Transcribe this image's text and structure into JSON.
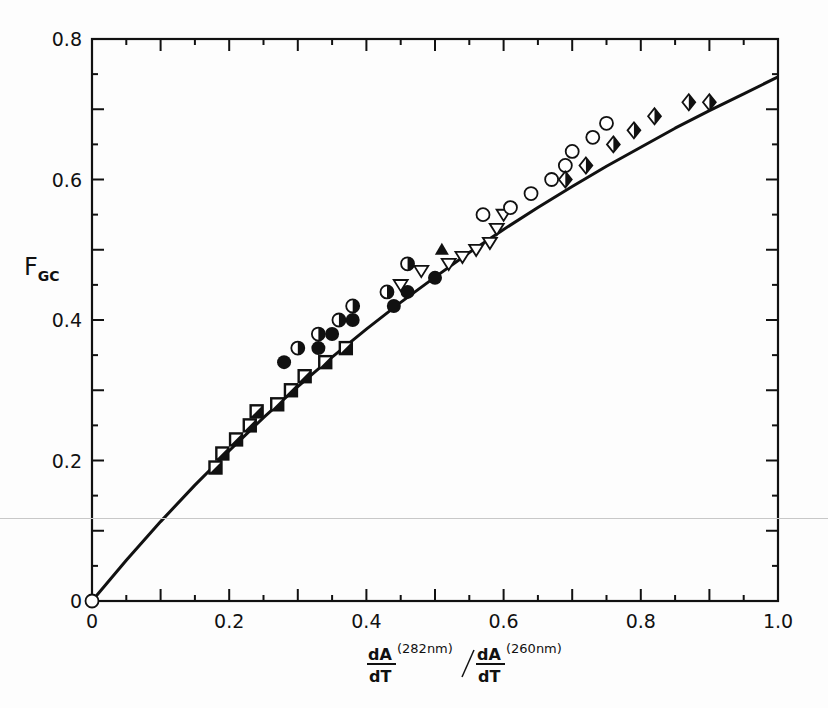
{
  "chart_data": {
    "type": "scatter",
    "title": "",
    "xlabel": "dA/dT (282nm) / dA/dT (260nm)",
    "xlabel_parts": {
      "num1": "dA",
      "den1": "dT",
      "sup1": "(282nm)",
      "num2": "dA",
      "den2": "dT",
      "sup2": "(260nm)"
    },
    "ylabel": "F",
    "ylabel_sub": "GC",
    "xlim": [
      0,
      1.0
    ],
    "ylim": [
      0,
      0.8
    ],
    "xticks": [
      0,
      0.2,
      0.4,
      0.6,
      0.8,
      1.0
    ],
    "xtick_labels": [
      "0",
      "0.2",
      "0.4",
      "0.6",
      "0.8",
      "1.0"
    ],
    "yticks": [
      0,
      0.2,
      0.4,
      0.6,
      0.8
    ],
    "ytick_labels": [
      "0",
      "0.2",
      "0.4",
      "0.6",
      "0.8"
    ],
    "x_minor_step": 0.05,
    "y_minor_step": 0.05,
    "grid": false,
    "legend": null,
    "fit_curve": {
      "name": "theoretical curve",
      "x": [
        0,
        0.05,
        0.1,
        0.15,
        0.2,
        0.25,
        0.3,
        0.35,
        0.4,
        0.45,
        0.5,
        0.55,
        0.6,
        0.65,
        0.7,
        0.75,
        0.8,
        0.85,
        0.9,
        0.95,
        1.0
      ],
      "y": [
        0,
        0.058,
        0.113,
        0.165,
        0.214,
        0.261,
        0.305,
        0.347,
        0.387,
        0.425,
        0.461,
        0.496,
        0.529,
        0.56,
        0.59,
        0.619,
        0.646,
        0.673,
        0.698,
        0.722,
        0.746
      ]
    },
    "series": [
      {
        "name": "origin point",
        "marker": "open-circle",
        "points": [
          [
            0,
            0
          ]
        ]
      },
      {
        "name": "half-filled squares",
        "marker": "half-square",
        "points": [
          [
            0.18,
            0.19
          ],
          [
            0.19,
            0.21
          ],
          [
            0.21,
            0.23
          ],
          [
            0.23,
            0.25
          ],
          [
            0.24,
            0.27
          ],
          [
            0.27,
            0.28
          ],
          [
            0.29,
            0.3
          ],
          [
            0.31,
            0.32
          ],
          [
            0.34,
            0.34
          ],
          [
            0.37,
            0.36
          ]
        ]
      },
      {
        "name": "filled circles",
        "marker": "filled-circle",
        "points": [
          [
            0.28,
            0.34
          ],
          [
            0.33,
            0.36
          ],
          [
            0.35,
            0.38
          ],
          [
            0.38,
            0.4
          ],
          [
            0.44,
            0.42
          ],
          [
            0.46,
            0.44
          ],
          [
            0.5,
            0.46
          ]
        ]
      },
      {
        "name": "half-filled circles",
        "marker": "half-circle",
        "points": [
          [
            0.3,
            0.36
          ],
          [
            0.33,
            0.38
          ],
          [
            0.36,
            0.4
          ],
          [
            0.38,
            0.42
          ],
          [
            0.43,
            0.44
          ],
          [
            0.46,
            0.48
          ]
        ]
      },
      {
        "name": "open triangles",
        "marker": "open-triangle-down",
        "points": [
          [
            0.45,
            0.45
          ],
          [
            0.48,
            0.47
          ],
          [
            0.52,
            0.48
          ],
          [
            0.54,
            0.49
          ],
          [
            0.56,
            0.5
          ],
          [
            0.58,
            0.51
          ],
          [
            0.59,
            0.53
          ],
          [
            0.6,
            0.55
          ]
        ]
      },
      {
        "name": "filled triangle",
        "marker": "filled-triangle",
        "points": [
          [
            0.51,
            0.5
          ]
        ]
      },
      {
        "name": "open circles",
        "marker": "open-circle",
        "points": [
          [
            0.57,
            0.55
          ],
          [
            0.61,
            0.56
          ],
          [
            0.64,
            0.58
          ],
          [
            0.67,
            0.6
          ],
          [
            0.69,
            0.62
          ],
          [
            0.7,
            0.64
          ],
          [
            0.73,
            0.66
          ],
          [
            0.75,
            0.68
          ]
        ]
      },
      {
        "name": "half-filled diamonds",
        "marker": "half-diamond",
        "points": [
          [
            0.69,
            0.6
          ],
          [
            0.72,
            0.62
          ],
          [
            0.76,
            0.65
          ],
          [
            0.79,
            0.67
          ],
          [
            0.82,
            0.69
          ],
          [
            0.87,
            0.71
          ],
          [
            0.9,
            0.71
          ]
        ]
      }
    ]
  },
  "layout": {
    "plot_left": 92,
    "plot_right": 778,
    "plot_top": 39,
    "plot_bottom": 601,
    "ink_color": "#111111",
    "background": "#fdfdfd"
  }
}
